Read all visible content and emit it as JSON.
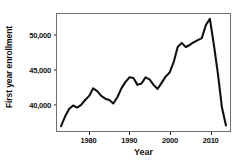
{
  "chart_data": {
    "type": "line",
    "title": "",
    "xlabel": "Year",
    "ylabel": "First year enrollment",
    "xlim": [
      1972,
      2015
    ],
    "ylim": [
      36200,
      53200
    ],
    "grid": false,
    "legend": null,
    "line_color": "#111111",
    "x_ticks": [
      1980,
      1990,
      2000,
      2010
    ],
    "x_tick_labels": [
      "1980",
      "1990",
      "2000",
      "2010"
    ],
    "y_ticks": [
      40000,
      45000,
      50000
    ],
    "y_tick_labels": [
      "40,000",
      "45,000",
      "50,000"
    ],
    "series": [
      {
        "name": "First year enrollment",
        "x": [
          1973,
          1974,
          1975,
          1976,
          1977,
          1978,
          1979,
          1980,
          1981,
          1982,
          1983,
          1984,
          1985,
          1986,
          1987,
          1988,
          1989,
          1990,
          1991,
          1992,
          1993,
          1994,
          1995,
          1996,
          1997,
          1998,
          1999,
          2000,
          2001,
          2002,
          2003,
          2004,
          2005,
          2006,
          2007,
          2008,
          2009,
          2010,
          2011,
          2012,
          2013,
          2014
        ],
        "values": [
          36900,
          38300,
          39400,
          39900,
          39600,
          40000,
          40700,
          41300,
          42400,
          42000,
          41300,
          40900,
          40700,
          40200,
          41100,
          42400,
          43300,
          44000,
          43900,
          42900,
          43100,
          44000,
          43700,
          42900,
          42300,
          43200,
          44100,
          44700,
          46200,
          48400,
          49000,
          48400,
          48700,
          49100,
          49400,
          49700,
          51600,
          52500,
          48700,
          44500,
          39600,
          37000
        ]
      }
    ]
  }
}
